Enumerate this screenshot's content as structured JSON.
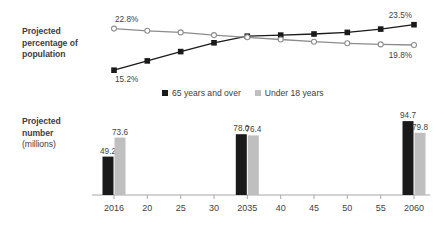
{
  "labels": {
    "pct_title_line1": "Projected",
    "pct_title_line2": "percentage of",
    "pct_title_line3": "population",
    "num_title_line1": "Projected",
    "num_title_line2": "number",
    "num_title_line3": "(millions)"
  },
  "legend": {
    "items": [
      {
        "label": "65 years and over",
        "color": "#1a1a1a"
      },
      {
        "label": "Under 18 years",
        "color": "#bfbfbf"
      }
    ]
  },
  "colors": {
    "older": "#1a1a1a",
    "younger": "#bfbfbf",
    "younger_line": "#8c8c8c",
    "axis": "#a6a6a6",
    "text": "#3f3f3f"
  },
  "chart_data": [
    {
      "type": "line",
      "title": "Projected percentage of population",
      "xlabel": "",
      "ylabel": "Projected percentage of population",
      "x": [
        "2016",
        "20",
        "25",
        "30",
        "2035",
        "40",
        "45",
        "50",
        "55",
        "2060"
      ],
      "ylim": [
        14.5,
        24.0
      ],
      "grid": false,
      "legend_position": "below",
      "series": [
        {
          "name": "65 years and over",
          "color": "#1a1a1a",
          "values": [
            15.2,
            16.9,
            18.6,
            20.2,
            21.4,
            21.6,
            21.8,
            22.1,
            22.7,
            23.5
          ],
          "point_labels": {
            "0": "15.2%",
            "9": "23.5%"
          }
        },
        {
          "name": "Under 18 years",
          "color": "#8c8c8c",
          "values": [
            22.8,
            22.4,
            22.1,
            21.6,
            21.2,
            20.8,
            20.4,
            20.1,
            19.9,
            19.8
          ],
          "point_labels": {
            "0": "22.8%",
            "9": "19.8%"
          }
        }
      ]
    },
    {
      "type": "bar",
      "title": "Projected number (millions)",
      "xlabel": "",
      "ylabel": "Projected number (millions)",
      "categories": [
        "2016",
        "20",
        "25",
        "30",
        "2035",
        "40",
        "45",
        "50",
        "55",
        "2060"
      ],
      "ylim": [
        0,
        100
      ],
      "grid": false,
      "series": [
        {
          "name": "65 years and over",
          "color": "#1a1a1a",
          "values": [
            49.2,
            null,
            null,
            null,
            78.0,
            null,
            null,
            null,
            null,
            94.7
          ],
          "labels": [
            "49.2",
            "",
            "",
            "",
            "78.0",
            "",
            "",
            "",
            "",
            "94.7"
          ]
        },
        {
          "name": "Under 18 years",
          "color": "#bfbfbf",
          "values": [
            73.6,
            null,
            null,
            null,
            76.4,
            null,
            null,
            null,
            null,
            79.8
          ],
          "labels": [
            "73.6",
            "",
            "",
            "",
            "76.4",
            "",
            "",
            "",
            "",
            "79.8"
          ]
        }
      ]
    }
  ],
  "axis": {
    "ticks": [
      "2016",
      "20",
      "25",
      "30",
      "2035",
      "40",
      "45",
      "50",
      "55",
      "2060"
    ]
  }
}
